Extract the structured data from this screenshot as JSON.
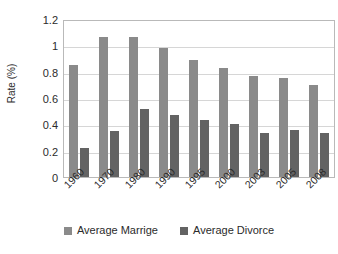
{
  "chart_data": {
    "type": "bar",
    "title": "",
    "xlabel": "",
    "ylabel": "Rate (%)",
    "ylim": [
      0,
      1.2
    ],
    "ytick_step": 0.2,
    "yticks": [
      "0",
      "0.2",
      "0.4",
      "0.6",
      "0.8",
      "1",
      "1.2"
    ],
    "grid": true,
    "legend_position": "bottom",
    "categories": [
      "1960",
      "1970",
      "1980",
      "1990",
      "1995",
      "2000",
      "2003",
      "2005",
      "2008"
    ],
    "series": [
      {
        "name": "Average Marrige",
        "color": "#8a8a8a",
        "values": [
          0.85,
          1.06,
          1.06,
          0.98,
          0.89,
          0.83,
          0.77,
          0.75,
          0.7
        ]
      },
      {
        "name": "Average Divorce",
        "color": "#636363",
        "values": [
          0.22,
          0.35,
          0.52,
          0.47,
          0.435,
          0.405,
          0.335,
          0.36,
          0.335
        ]
      }
    ]
  },
  "colors": {
    "marriage": "#8a8a8a",
    "divorce": "#636363",
    "gridline": "#d6d6d6",
    "plot_border": "#b9b9b9",
    "text": "#2b2b2b",
    "background": "#ffffff"
  }
}
